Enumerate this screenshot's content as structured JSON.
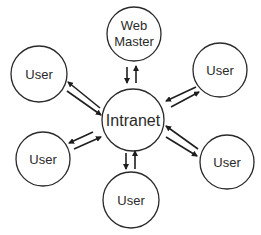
{
  "diagram": {
    "title": "",
    "nodes": [
      {
        "id": "intranet",
        "label": "Intranet",
        "cx": 133,
        "cy": 120,
        "r": 31,
        "font_size": 15
      },
      {
        "id": "webmaster",
        "label_lines": [
          "Web",
          "Master"
        ],
        "cx": 134,
        "cy": 34,
        "r": 27,
        "font_size": 13
      },
      {
        "id": "user_tl",
        "label": "User",
        "cx": 39,
        "cy": 74,
        "r": 28,
        "font_size": 13
      },
      {
        "id": "user_tr",
        "label": "User",
        "cx": 220,
        "cy": 70,
        "r": 27,
        "font_size": 13
      },
      {
        "id": "user_bl",
        "label": "User",
        "cx": 43,
        "cy": 159,
        "r": 27,
        "font_size": 13
      },
      {
        "id": "user_br",
        "label": "User",
        "cx": 227,
        "cy": 162,
        "r": 27,
        "font_size": 13
      },
      {
        "id": "user_b",
        "label": "User",
        "cx": 131,
        "cy": 200,
        "r": 28,
        "font_size": 13
      }
    ],
    "edges": [
      {
        "from": "intranet",
        "to": "webmaster",
        "type": "bidirectional"
      },
      {
        "from": "intranet",
        "to": "user_tl",
        "type": "bidirectional"
      },
      {
        "from": "intranet",
        "to": "user_tr",
        "type": "bidirectional"
      },
      {
        "from": "intranet",
        "to": "user_bl",
        "type": "bidirectional"
      },
      {
        "from": "intranet",
        "to": "user_br",
        "type": "bidirectional"
      },
      {
        "from": "intranet",
        "to": "user_b",
        "type": "bidirectional"
      }
    ],
    "colors": {
      "stroke": "#2a2a2a",
      "background": "#ffffff"
    }
  },
  "labels": {
    "intranet": "Intranet",
    "webmaster_line1": "Web",
    "webmaster_line2": "Master",
    "user": "User"
  }
}
